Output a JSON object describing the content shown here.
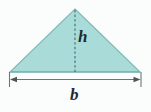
{
  "figure": {
    "name": "triangle-area-diagram",
    "background_color": "#fbfdfd"
  },
  "shape": {
    "type": "triangle",
    "fill_color": "#a9dcd8",
    "stroke_color": "#7fb9b5",
    "apex": {
      "x": 75,
      "y": 9
    },
    "left_vertex": {
      "x": 10,
      "y": 72
    },
    "right_vertex": {
      "x": 140,
      "y": 72
    }
  },
  "height_line": {
    "label": "h",
    "style": "dashed",
    "color": "#3f6b70",
    "x": 75,
    "y_top": 10,
    "y_bottom": 72,
    "label_color": "#1d2b33"
  },
  "base_dimension": {
    "label": "b",
    "color": "#6d7579",
    "y": 79,
    "x_start": 10,
    "x_end": 141,
    "tick_top": 72,
    "tick_bottom": 87,
    "arrowheads": "both",
    "label_color": "#1d2b33"
  }
}
